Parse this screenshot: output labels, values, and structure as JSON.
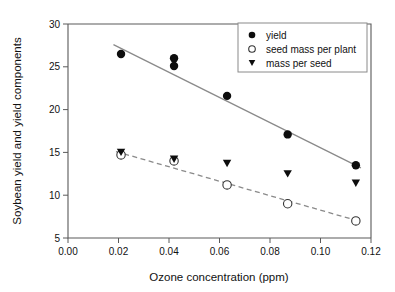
{
  "chart_data": {
    "type": "scatter",
    "title": "",
    "xlabel": "Ozone concentration (ppm)",
    "ylabel": "Soybean yield and yield components",
    "xlim": [
      0.0,
      0.12
    ],
    "ylim": [
      5,
      30
    ],
    "xticks": [
      "0.00",
      "0.02",
      "0.04",
      "0.06",
      "0.08",
      "0.10",
      "0.12"
    ],
    "xtick_values": [
      0.0,
      0.02,
      0.04,
      0.06,
      0.08,
      0.1,
      0.12
    ],
    "yticks": [
      "5",
      "10",
      "15",
      "20",
      "25",
      "30"
    ],
    "ytick_values": [
      5,
      10,
      15,
      20,
      25,
      30
    ],
    "grid": false,
    "legend_position": "top-right",
    "series": [
      {
        "name": "yield",
        "marker": "filled-circle",
        "x": [
          0.021,
          0.042,
          0.042,
          0.063,
          0.087,
          0.114
        ],
        "y": [
          26.5,
          26.0,
          25.1,
          21.6,
          17.1,
          13.5
        ],
        "fit_line": {
          "style": "solid",
          "x": [
            0.018,
            0.116
          ],
          "y": [
            27.6,
            13.2
          ]
        }
      },
      {
        "name": "seed mass per plant",
        "marker": "open-circle",
        "x": [
          0.021,
          0.042,
          0.063,
          0.087,
          0.114
        ],
        "y": [
          14.7,
          14.0,
          11.2,
          9.0,
          7.0
        ],
        "fit_line": {
          "style": "dashed",
          "x": [
            0.019,
            0.116
          ],
          "y": [
            15.1,
            6.9
          ]
        }
      },
      {
        "name": "mass per seed",
        "marker": "filled-triangle-down",
        "x": [
          0.021,
          0.042,
          0.063,
          0.087,
          0.114
        ],
        "y": [
          15.0,
          14.2,
          13.7,
          12.5,
          11.4
        ],
        "fit_line": null
      }
    ]
  },
  "legend": {
    "items": [
      {
        "label": "yield",
        "marker": "filled-circle"
      },
      {
        "label": "seed mass per plant",
        "marker": "open-circle"
      },
      {
        "label": "mass per seed",
        "marker": "filled-triangle-down"
      }
    ]
  },
  "colors": {
    "marker": "#0d0d0d",
    "axis": "#5a5a5a",
    "fit_line": "#8a8a8a",
    "background": "#ffffff",
    "text": "#111111"
  }
}
